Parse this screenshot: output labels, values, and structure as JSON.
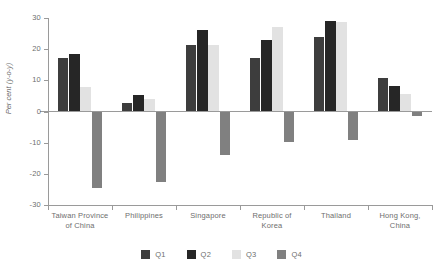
{
  "chart_data": {
    "type": "bar",
    "title": "",
    "subtitle": "",
    "xlabel": "",
    "ylabel": "Per cent (y-o-y)",
    "ylim": [
      -30,
      30
    ],
    "yticks": [
      30,
      20,
      10,
      0,
      -10,
      -20,
      -30
    ],
    "ytick_labels": [
      "30",
      "20",
      "10",
      "0",
      "-10",
      "-20",
      "-30"
    ],
    "grid": false,
    "legend_position": "bottom",
    "categories": [
      "Taiwan Province of China",
      "Philippines",
      "Singapore",
      "Republic of Korea",
      "Thailand",
      "Hong Kong, China"
    ],
    "category_lines": [
      [
        "Taiwan Province",
        "of China"
      ],
      [
        "Philippines"
      ],
      [
        "Singapore"
      ],
      [
        "Republic of",
        "Korea"
      ],
      [
        "Thailand"
      ],
      [
        "Hong Kong,",
        "China"
      ]
    ],
    "series": [
      {
        "name": "Q1",
        "color": "#3d3d3d",
        "values": [
          17.3,
          2.7,
          21.2,
          17.3,
          23.9,
          10.7
        ]
      },
      {
        "name": "Q2",
        "color": "#262626",
        "values": [
          18.4,
          5.2,
          26.3,
          23.0,
          29.0,
          8.2
        ]
      },
      {
        "name": "Q3",
        "color": "#e2e2e2",
        "values": [
          7.8,
          4.0,
          21.2,
          27.0,
          28.7,
          5.6
        ]
      },
      {
        "name": "Q4",
        "color": "#808080",
        "values": [
          -24.7,
          -22.6,
          -13.9,
          -9.8,
          -9.3,
          -1.3
        ]
      }
    ]
  },
  "legend": {
    "items": [
      {
        "label": "Q1",
        "color": "#3d3d3d"
      },
      {
        "label": "Q2",
        "color": "#262626"
      },
      {
        "label": "Q3",
        "color": "#e2e2e2"
      },
      {
        "label": "Q4",
        "color": "#808080"
      }
    ]
  },
  "axis": {
    "y_title": "Per cent (y-o-y)"
  }
}
